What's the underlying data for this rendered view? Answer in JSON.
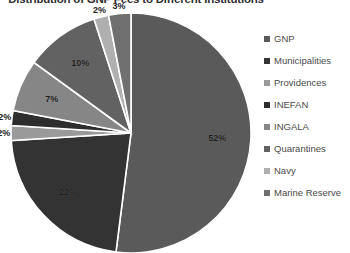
{
  "chart_data": {
    "type": "pie",
    "title": "Distribution of GNP Fees to Different Institutions",
    "xlabel": "",
    "ylabel": "",
    "legend_position": "right",
    "grid": false,
    "start_angle_deg": 0,
    "direction": "clockwise",
    "categories": [
      "GNP",
      "Municipalities",
      "Providences",
      "INEFAN",
      "INGALA",
      "Quarantines",
      "Navy",
      "Marine Reserve"
    ],
    "values": [
      52,
      22,
      2,
      2,
      7,
      10,
      2,
      3
    ],
    "labels": [
      "52%",
      "22%",
      "2%",
      "2%",
      "7%",
      "10%",
      "2%",
      "3%"
    ],
    "colors": [
      "#5a5a5a",
      "#333333",
      "#9a9a9a",
      "#2e2e2e",
      "#868686",
      "#626262",
      "#b0b0b0",
      "#707070"
    ],
    "slices": [
      {
        "name": "GNP",
        "value": 52,
        "label": "52%",
        "color": "#5a5a5a"
      },
      {
        "name": "Municipalities",
        "value": 22,
        "label": "22%",
        "color": "#333333"
      },
      {
        "name": "Providences",
        "value": 2,
        "label": "2%",
        "color": "#9a9a9a"
      },
      {
        "name": "INEFAN",
        "value": 2,
        "label": "2%",
        "color": "#2e2e2e"
      },
      {
        "name": "INGALA",
        "value": 7,
        "label": "7%",
        "color": "#868686"
      },
      {
        "name": "Quarantines",
        "value": 10,
        "label": "10%",
        "color": "#626262"
      },
      {
        "name": "Navy",
        "value": 2,
        "label": "2%",
        "color": "#b0b0b0"
      },
      {
        "name": "Marine Reserve",
        "value": 3,
        "label": "3%",
        "color": "#707070"
      }
    ]
  },
  "legend": {
    "items": [
      {
        "label": "GNP",
        "color": "#5a5a5a"
      },
      {
        "label": "Municipalities",
        "color": "#333333"
      },
      {
        "label": "Providences",
        "color": "#9a9a9a"
      },
      {
        "label": "INEFAN",
        "color": "#2e2e2e"
      },
      {
        "label": "INGALA",
        "color": "#868686"
      },
      {
        "label": "Quarantines",
        "color": "#626262"
      },
      {
        "label": "Navy",
        "color": "#b0b0b0"
      },
      {
        "label": "Marine Reserve",
        "color": "#707070"
      }
    ]
  }
}
